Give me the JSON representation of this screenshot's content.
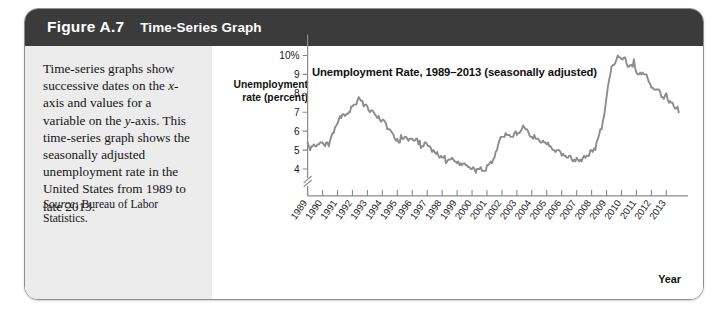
{
  "figure": {
    "number": "Figure A.7",
    "title": "Time-Series Graph"
  },
  "caption": {
    "body_part1": "Time-series graphs show successive dates on the ",
    "x_axis_italic": "x",
    "body_part2": "-axis and values for a variable on the ",
    "y_axis_italic": "y",
    "body_part3": "-axis. This time-series graph shows the seasonally adjusted unemployment rate in the United States from 1989 to late 2013.",
    "source_label": "Source:",
    "source_text": " Bureau of Labor Statistics."
  },
  "chart_data": {
    "type": "line",
    "title": "Unemployment Rate, 1989–2013 (seasonally adjusted)",
    "ylabel": "Unemployment rate (percent)",
    "xlabel": "Year",
    "ylim": [
      3.5,
      10.4
    ],
    "ytick_labels": [
      "10%",
      "9",
      "8",
      "7",
      "6",
      "5",
      "4"
    ],
    "ytick_values": [
      10,
      9,
      8,
      7,
      6,
      5,
      4
    ],
    "y_axis_break": true,
    "grid": false,
    "legend": "none",
    "line_color": "#8c8c8c",
    "xtick_labels": [
      "1989",
      "1990",
      "1991",
      "1992",
      "1993",
      "1994",
      "1995",
      "1996",
      "1997",
      "1998",
      "1999",
      "2000",
      "2001",
      "2002",
      "2003",
      "2004",
      "2005",
      "2006",
      "2007",
      "2008",
      "2009",
      "2010",
      "2011",
      "2012",
      "2013"
    ],
    "xlim": [
      1989,
      2013.92
    ],
    "series": [
      {
        "name": "Unemployment rate (percent)",
        "x": [
          1989.0,
          1989.08,
          1989.17,
          1989.25,
          1989.33,
          1989.42,
          1989.5,
          1989.58,
          1989.67,
          1989.75,
          1989.83,
          1989.92,
          1990.0,
          1990.08,
          1990.17,
          1990.25,
          1990.33,
          1990.42,
          1990.5,
          1990.58,
          1990.67,
          1990.75,
          1990.83,
          1990.92,
          1991.0,
          1991.08,
          1991.17,
          1991.25,
          1991.33,
          1991.42,
          1991.5,
          1991.58,
          1991.67,
          1991.75,
          1991.83,
          1991.92,
          1992.0,
          1992.08,
          1992.17,
          1992.25,
          1992.33,
          1992.42,
          1992.5,
          1992.58,
          1992.67,
          1992.75,
          1992.83,
          1992.92,
          1993.0,
          1993.08,
          1993.17,
          1993.25,
          1993.33,
          1993.42,
          1993.5,
          1993.58,
          1993.67,
          1993.75,
          1993.83,
          1993.92,
          1994.0,
          1994.08,
          1994.17,
          1994.25,
          1994.33,
          1994.42,
          1994.5,
          1994.58,
          1994.67,
          1994.75,
          1994.83,
          1994.92,
          1995.0,
          1995.08,
          1995.17,
          1995.25,
          1995.33,
          1995.42,
          1995.5,
          1995.58,
          1995.67,
          1995.75,
          1995.83,
          1995.92,
          1996.0,
          1996.08,
          1996.17,
          1996.25,
          1996.33,
          1996.42,
          1996.5,
          1996.58,
          1996.67,
          1996.75,
          1996.83,
          1996.92,
          1997.0,
          1997.08,
          1997.17,
          1997.25,
          1997.33,
          1997.42,
          1997.5,
          1997.58,
          1997.67,
          1997.75,
          1997.83,
          1997.92,
          1998.0,
          1998.08,
          1998.17,
          1998.25,
          1998.33,
          1998.42,
          1998.5,
          1998.58,
          1998.67,
          1998.75,
          1998.83,
          1998.92,
          1999.0,
          1999.08,
          1999.17,
          1999.25,
          1999.33,
          1999.42,
          1999.5,
          1999.58,
          1999.67,
          1999.75,
          1999.83,
          1999.92,
          2000.0,
          2000.08,
          2000.17,
          2000.25,
          2000.33,
          2000.42,
          2000.5,
          2000.58,
          2000.67,
          2000.75,
          2000.83,
          2000.92,
          2001.0,
          2001.08,
          2001.17,
          2001.25,
          2001.33,
          2001.42,
          2001.5,
          2001.58,
          2001.67,
          2001.75,
          2001.83,
          2001.92,
          2002.0,
          2002.08,
          2002.17,
          2002.25,
          2002.33,
          2002.42,
          2002.5,
          2002.58,
          2002.67,
          2002.75,
          2002.83,
          2002.92,
          2003.0,
          2003.08,
          2003.17,
          2003.25,
          2003.33,
          2003.42,
          2003.5,
          2003.58,
          2003.67,
          2003.75,
          2003.83,
          2003.92,
          2004.0,
          2004.08,
          2004.17,
          2004.25,
          2004.33,
          2004.42,
          2004.5,
          2004.58,
          2004.67,
          2004.75,
          2004.83,
          2004.92,
          2005.0,
          2005.08,
          2005.17,
          2005.25,
          2005.33,
          2005.42,
          2005.5,
          2005.58,
          2005.67,
          2005.75,
          2005.83,
          2005.92,
          2006.0,
          2006.08,
          2006.17,
          2006.25,
          2006.33,
          2006.42,
          2006.5,
          2006.58,
          2006.67,
          2006.75,
          2006.83,
          2006.92,
          2007.0,
          2007.08,
          2007.17,
          2007.25,
          2007.33,
          2007.42,
          2007.5,
          2007.58,
          2007.67,
          2007.75,
          2007.83,
          2007.92,
          2008.0,
          2008.08,
          2008.17,
          2008.25,
          2008.33,
          2008.42,
          2008.5,
          2008.58,
          2008.67,
          2008.75,
          2008.83,
          2008.92,
          2009.0,
          2009.08,
          2009.17,
          2009.25,
          2009.33,
          2009.42,
          2009.5,
          2009.58,
          2009.67,
          2009.75,
          2009.83,
          2009.92,
          2010.0,
          2010.08,
          2010.17,
          2010.25,
          2010.33,
          2010.42,
          2010.5,
          2010.58,
          2010.67,
          2010.75,
          2010.83,
          2010.92,
          2011.0,
          2011.08,
          2011.17,
          2011.25,
          2011.33,
          2011.42,
          2011.5,
          2011.58,
          2011.67,
          2011.75,
          2011.83,
          2011.92,
          2012.0,
          2012.08,
          2012.17,
          2012.25,
          2012.33,
          2012.42,
          2012.5,
          2012.58,
          2012.67,
          2012.75,
          2012.83,
          2012.92,
          2013.0,
          2013.08,
          2013.17,
          2013.25,
          2013.33,
          2013.42,
          2013.5,
          2013.58,
          2013.67,
          2013.75,
          2013.83
        ],
        "values": [
          5.4,
          5.2,
          5.0,
          5.2,
          5.2,
          5.3,
          5.2,
          5.2,
          5.3,
          5.3,
          5.4,
          5.4,
          5.4,
          5.3,
          5.2,
          5.4,
          5.4,
          5.2,
          5.5,
          5.7,
          5.9,
          5.9,
          6.2,
          6.3,
          6.4,
          6.6,
          6.8,
          6.7,
          6.9,
          6.9,
          6.8,
          6.9,
          6.9,
          7.0,
          7.0,
          7.3,
          7.3,
          7.4,
          7.4,
          7.4,
          7.6,
          7.8,
          7.7,
          7.6,
          7.6,
          7.3,
          7.4,
          7.4,
          7.3,
          7.1,
          7.0,
          7.1,
          7.1,
          7.0,
          6.9,
          6.8,
          6.7,
          6.8,
          6.6,
          6.5,
          6.6,
          6.6,
          6.5,
          6.4,
          6.1,
          6.1,
          6.1,
          6.0,
          5.9,
          5.8,
          5.6,
          5.5,
          5.6,
          5.4,
          5.4,
          5.8,
          5.6,
          5.6,
          5.7,
          5.7,
          5.6,
          5.5,
          5.6,
          5.6,
          5.6,
          5.5,
          5.5,
          5.6,
          5.6,
          5.3,
          5.5,
          5.1,
          5.2,
          5.2,
          5.4,
          5.4,
          5.3,
          5.2,
          5.2,
          5.1,
          4.9,
          5.0,
          4.9,
          4.8,
          4.9,
          4.7,
          4.6,
          4.7,
          4.6,
          4.6,
          4.7,
          4.3,
          4.4,
          4.5,
          4.5,
          4.5,
          4.6,
          4.5,
          4.4,
          4.4,
          4.3,
          4.4,
          4.2,
          4.3,
          4.2,
          4.3,
          4.3,
          4.2,
          4.2,
          4.1,
          4.1,
          4.0,
          4.0,
          4.1,
          4.0,
          3.8,
          4.0,
          4.0,
          4.0,
          4.1,
          3.9,
          3.9,
          3.9,
          3.9,
          4.2,
          4.2,
          4.3,
          4.4,
          4.3,
          4.5,
          4.6,
          4.9,
          5.0,
          5.3,
          5.5,
          5.7,
          5.7,
          5.7,
          5.7,
          5.9,
          5.8,
          5.8,
          5.8,
          5.7,
          5.7,
          5.7,
          5.9,
          6.0,
          5.8,
          5.9,
          5.9,
          6.0,
          6.1,
          6.3,
          6.2,
          6.1,
          6.1,
          6.0,
          5.8,
          5.7,
          5.7,
          5.6,
          5.8,
          5.6,
          5.6,
          5.6,
          5.5,
          5.4,
          5.4,
          5.5,
          5.4,
          5.4,
          5.3,
          5.4,
          5.2,
          5.2,
          5.1,
          5.0,
          5.0,
          4.9,
          5.0,
          5.0,
          5.0,
          4.9,
          4.7,
          4.8,
          4.7,
          4.7,
          4.6,
          4.6,
          4.7,
          4.7,
          4.5,
          4.4,
          4.5,
          4.4,
          4.6,
          4.5,
          4.4,
          4.5,
          4.4,
          4.6,
          4.7,
          4.6,
          4.7,
          4.7,
          4.7,
          5.0,
          5.0,
          4.9,
          5.1,
          5.0,
          5.4,
          5.6,
          5.8,
          6.1,
          6.1,
          6.5,
          6.8,
          7.3,
          7.8,
          8.3,
          8.7,
          9.0,
          9.4,
          9.5,
          9.5,
          9.6,
          9.8,
          10.0,
          9.9,
          9.9,
          9.8,
          9.8,
          9.9,
          9.9,
          9.6,
          9.4,
          9.4,
          9.5,
          9.5,
          9.4,
          9.8,
          9.3,
          9.1,
          9.0,
          9.0,
          9.1,
          9.0,
          9.1,
          9.0,
          9.0,
          9.0,
          8.8,
          8.6,
          8.5,
          8.3,
          8.3,
          8.2,
          8.2,
          8.2,
          8.2,
          8.2,
          8.1,
          7.8,
          7.8,
          7.7,
          7.9,
          8.0,
          7.7,
          7.5,
          7.6,
          7.5,
          7.5,
          7.3,
          7.2,
          7.2,
          7.3,
          7.0
        ]
      }
    ]
  }
}
